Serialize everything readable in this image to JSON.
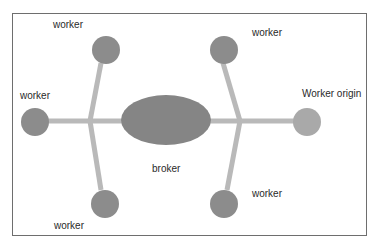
{
  "diagram": {
    "colors": {
      "worker_fill": "#8c8c8c",
      "worker_origin_fill": "#a9a9a9",
      "broker_fill": "#858585",
      "connector": "#b9b9b9",
      "frame": "#6e6e6e"
    },
    "nodes": [
      {
        "id": "broker",
        "label": "broker",
        "shape": "ellipse"
      },
      {
        "id": "worker_top_left",
        "label": "worker",
        "shape": "circle"
      },
      {
        "id": "worker_left",
        "label": "worker",
        "shape": "circle"
      },
      {
        "id": "worker_bottom_left",
        "label": "worker",
        "shape": "circle"
      },
      {
        "id": "worker_top_right",
        "label": "worker",
        "shape": "circle"
      },
      {
        "id": "worker_origin",
        "label": "Worker origin",
        "shape": "circle"
      },
      {
        "id": "worker_bottom_right",
        "label": "worker",
        "shape": "circle"
      }
    ],
    "edges": [
      {
        "from": "worker_left",
        "to": "broker"
      },
      {
        "from": "worker_top_left",
        "to": "junction_left"
      },
      {
        "from": "worker_bottom_left",
        "to": "junction_left"
      },
      {
        "from": "broker",
        "to": "worker_origin"
      },
      {
        "from": "worker_top_right",
        "to": "junction_right"
      },
      {
        "from": "worker_bottom_right",
        "to": "junction_right"
      }
    ]
  }
}
